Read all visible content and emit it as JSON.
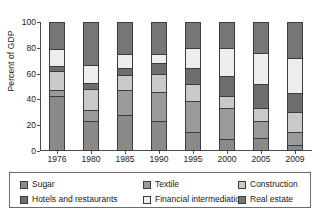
{
  "chart_data": {
    "type": "bar",
    "subtype": "stacked-bar-100-percent",
    "title": "",
    "subtitle": "",
    "xlabel": "",
    "ylabel": "Percent of GDP",
    "categories": [
      "1976",
      "1980",
      "1985",
      "1990",
      "1995",
      "2000",
      "2005",
      "2009"
    ],
    "ylim": [
      0,
      100
    ],
    "yticks": [
      0,
      20,
      40,
      60,
      80,
      100
    ],
    "ytick_labels": [
      "0",
      "20",
      "40",
      "60",
      "80",
      "100"
    ],
    "grid": false,
    "legend_position": "bottom",
    "legend_columns": 3,
    "legend_rows": 2,
    "series": [
      {
        "name": "Sugar",
        "color": "#8a8a8a",
        "values": [
          43,
          23,
          28,
          23,
          15,
          9,
          10,
          5
        ]
      },
      {
        "name": "Textile",
        "color": "#9a9a9a",
        "values": [
          4,
          9,
          19,
          23,
          24,
          24,
          13,
          10
        ]
      },
      {
        "name": "Construction",
        "color": "#c9c9c9",
        "values": [
          15,
          16,
          12,
          14,
          13,
          10,
          10,
          15
        ]
      },
      {
        "name": "Hotels and restaurants",
        "color": "#6e6e6e",
        "values": [
          4,
          5,
          5,
          8,
          12,
          15,
          19,
          15
        ]
      },
      {
        "name": "Financial intermediation",
        "color": "#ededed",
        "values": [
          13,
          14,
          11,
          7,
          16,
          22,
          24,
          27
        ]
      },
      {
        "name": "Real estate",
        "color": "#767676",
        "values": [
          21,
          33,
          25,
          25,
          20,
          20,
          24,
          28
        ]
      }
    ]
  },
  "axis": {
    "y_label": "Percent of GDP"
  },
  "legend": {
    "items": [
      {
        "label": "Sugar",
        "color": "#8a8a8a"
      },
      {
        "label": "Textile",
        "color": "#9a9a9a"
      },
      {
        "label": "Construction",
        "color": "#c9c9c9"
      },
      {
        "label": "Hotels and restaurants",
        "color": "#6e6e6e"
      },
      {
        "label": "Financial intermediation",
        "color": "#ededed"
      },
      {
        "label": "Real estate",
        "color": "#767676"
      }
    ]
  }
}
